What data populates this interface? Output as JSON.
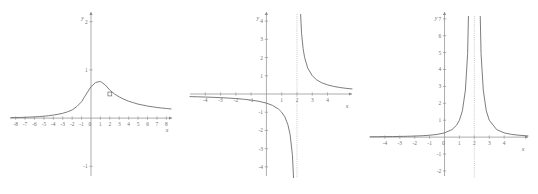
{
  "figure": {
    "background_color": "#ffffff",
    "curve_color": "#6e6e6e",
    "axis_color": "#8a8a8a",
    "asymptote_color": "#b5b5b5",
    "panel_count": 3
  },
  "chart_data": [
    {
      "type": "line",
      "title": "",
      "xlabel": "x",
      "ylabel": "y",
      "xlim": [
        -8.6,
        8.6
      ],
      "ylim": [
        -1.2,
        2.2
      ],
      "xticks": [
        -8,
        -7,
        -6,
        -5,
        -4,
        -3,
        -2,
        -1,
        0,
        1,
        2,
        3,
        4,
        5,
        6,
        7,
        8
      ],
      "xtick_labels": [
        "-8",
        "-7",
        "-6",
        "-5",
        "-4",
        "-3",
        "-2",
        "-1",
        "0",
        "1",
        "2",
        "3",
        "4",
        "5",
        "6",
        "7",
        "8"
      ],
      "yticks": [
        -1,
        1,
        2
      ],
      "ytick_labels": [
        "-1",
        "1",
        "2"
      ],
      "grid": false,
      "legend": "none",
      "annotations": [
        {
          "kind": "open-point",
          "x": 2.0,
          "y": 0.5,
          "label": ""
        }
      ],
      "series": [
        {
          "name": "curve-1",
          "x": [
            -8.5,
            -8,
            -7.5,
            -7,
            -6.5,
            -6,
            -5.5,
            -5,
            -4.5,
            -4,
            -3.5,
            -3,
            -2.5,
            -2,
            -1.5,
            -1,
            -0.5,
            0,
            0.5,
            1,
            1.5,
            2,
            2.5,
            3,
            3.5,
            4,
            4.5,
            5,
            5.5,
            6,
            6.5,
            7,
            7.5,
            8,
            8.5
          ],
          "y": [
            0.01,
            0.012,
            0.014,
            0.017,
            0.021,
            0.026,
            0.032,
            0.04,
            0.05,
            0.063,
            0.08,
            0.1,
            0.13,
            0.17,
            0.24,
            0.34,
            0.5,
            0.65,
            0.74,
            0.76,
            0.69,
            0.58,
            0.5,
            0.44,
            0.39,
            0.35,
            0.32,
            0.29,
            0.27,
            0.25,
            0.235,
            0.22,
            0.21,
            0.2,
            0.19
          ]
        }
      ]
    },
    {
      "type": "line",
      "title": "",
      "xlabel": "x",
      "ylabel": "y",
      "xlim": [
        -5.0,
        5.6
      ],
      "ylim": [
        -4.5,
        4.5
      ],
      "xticks": [
        -4,
        -3,
        -2,
        -1,
        1,
        2,
        3,
        4
      ],
      "xtick_labels": [
        "-4",
        "-3",
        "-2",
        "-1",
        "1",
        "2",
        "3",
        "4"
      ],
      "yticks": [
        -4,
        -3,
        -2,
        -1,
        1,
        2,
        3,
        4
      ],
      "ytick_labels": [
        "-4",
        "-3",
        "-2",
        "-1",
        "1",
        "2",
        "3",
        "4"
      ],
      "grid": false,
      "legend": "none",
      "asymptotes": [
        {
          "kind": "vertical",
          "x": 2.0
        }
      ],
      "annotations": [],
      "series": [
        {
          "name": "left-branch",
          "x": [
            -5.0,
            -4.5,
            -4.0,
            -3.5,
            -3.0,
            -2.5,
            -2.0,
            -1.5,
            -1.0,
            -0.5,
            0.0,
            0.4,
            0.8,
            1.0,
            1.2,
            1.4,
            1.55,
            1.7,
            1.8,
            1.85,
            1.9,
            1.93,
            1.95,
            1.97
          ],
          "y": [
            -0.143,
            -0.154,
            -0.167,
            -0.182,
            -0.2,
            -0.222,
            -0.25,
            -0.286,
            -0.333,
            -0.4,
            -0.5,
            -0.625,
            -0.833,
            -1.0,
            -1.25,
            -1.667,
            -2.22,
            -3.33,
            -5.0,
            -6.67,
            -10.0,
            -14.3,
            -20.0,
            -33.3
          ]
        },
        {
          "name": "right-branch",
          "x": [
            2.03,
            2.05,
            2.07,
            2.1,
            2.15,
            2.2,
            2.3,
            2.4,
            2.5,
            2.7,
            3.0,
            3.3,
            3.6,
            4.0,
            4.4,
            4.8,
            5.2,
            5.6
          ],
          "y": [
            33.3,
            20.0,
            14.3,
            10.0,
            6.67,
            5.0,
            3.33,
            2.5,
            2.0,
            1.43,
            1.0,
            0.769,
            0.625,
            0.5,
            0.417,
            0.357,
            0.313,
            0.278
          ]
        }
      ]
    },
    {
      "type": "line",
      "title": "",
      "xlabel": "x",
      "ylabel": "y",
      "xlim": [
        -5.0,
        5.6
      ],
      "ylim": [
        -2.3,
        7.4
      ],
      "xticks": [
        -4,
        -3,
        -2,
        -1,
        0,
        1,
        2,
        3,
        4
      ],
      "xtick_labels": [
        "-4",
        "-3",
        "-2",
        "-1",
        "0",
        "1",
        "2",
        "3",
        "4"
      ],
      "yticks": [
        -2,
        -1,
        1,
        2,
        3,
        4,
        5,
        6,
        7
      ],
      "ytick_labels": [
        "-2",
        "-1",
        "1",
        "2",
        "3",
        "4",
        "5",
        "6",
        "7"
      ],
      "grid": false,
      "legend": "none",
      "asymptotes": [
        {
          "kind": "vertical",
          "x": 2.0
        }
      ],
      "annotations": [],
      "series": [
        {
          "name": "left-branch",
          "x": [
            -5.0,
            -4.5,
            -4.0,
            -3.5,
            -3.0,
            -2.5,
            -2.0,
            -1.5,
            -1.0,
            -0.5,
            0.0,
            0.5,
            0.8,
            1.0,
            1.2,
            1.4,
            1.55,
            1.7,
            1.8,
            1.87,
            1.92,
            1.95,
            1.97
          ],
          "y": [
            0.02,
            0.024,
            0.028,
            0.033,
            0.04,
            0.049,
            0.063,
            0.082,
            0.111,
            0.16,
            0.25,
            0.444,
            0.694,
            1.0,
            1.56,
            2.78,
            4.94,
            11.1,
            25.0,
            59.2,
            156,
            400,
            1111
          ]
        },
        {
          "name": "right-branch",
          "x": [
            2.03,
            2.05,
            2.08,
            2.13,
            2.2,
            2.3,
            2.45,
            2.6,
            2.8,
            3.0,
            3.5,
            4.0,
            4.5,
            5.0,
            5.6
          ],
          "y": [
            1111,
            400,
            156,
            59.2,
            25.0,
            11.1,
            4.94,
            2.78,
            1.56,
            1.0,
            0.444,
            0.25,
            0.16,
            0.111,
            0.069
          ]
        }
      ]
    }
  ]
}
